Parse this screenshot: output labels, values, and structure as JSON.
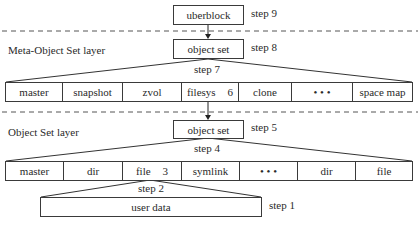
{
  "diagram": {
    "uberblock": {
      "label": "uberblock",
      "step": "step 9"
    },
    "mos_layer": {
      "title": "Meta-Object Set layer",
      "object_set": {
        "label": "object set",
        "step": "step 8"
      },
      "fanout_step": "step 7",
      "cells": [
        {
          "label": "master"
        },
        {
          "label": "snapshot"
        },
        {
          "label": "zvol"
        },
        {
          "label": "filesys",
          "num": "6"
        },
        {
          "label": "clone"
        },
        {
          "label": "• • •"
        },
        {
          "label": "space map"
        }
      ]
    },
    "os_layer": {
      "title": "Object Set layer",
      "object_set": {
        "label": "object set",
        "step": "step 5"
      },
      "fanout_step": "step 4",
      "cells": [
        {
          "label": "master"
        },
        {
          "label": "dir"
        },
        {
          "label": "file",
          "num": "3"
        },
        {
          "label": "symlink"
        },
        {
          "label": "• • •"
        },
        {
          "label": "dir"
        },
        {
          "label": "file"
        }
      ]
    },
    "user_data": {
      "label": "user data",
      "fanout_step": "step 2",
      "step": "step 1"
    }
  }
}
